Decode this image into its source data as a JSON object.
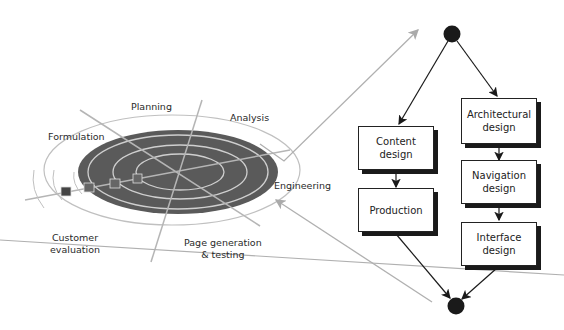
{
  "spiral": {
    "labels": {
      "planning": "Planning",
      "analysis": "Analysis",
      "formulation": "Formulation",
      "engineering": "Engineering",
      "customer_evaluation_line1": "Customer",
      "customer_evaluation_line2": "evaluation",
      "page_generation_line1": "Page generation",
      "page_generation_line2": "& testing"
    }
  },
  "flow": {
    "content_design": {
      "line1": "Content",
      "line2": "design"
    },
    "production": {
      "line1": "Production"
    },
    "architectural_design": {
      "line1": "Architectural",
      "line2": "design"
    },
    "navigation_design": {
      "line1": "Navigation",
      "line2": "design"
    },
    "interface_design": {
      "line1": "Interface",
      "line2": "design"
    }
  },
  "colors": {
    "ellipse_fill": "#5a5a5a",
    "ring_stroke": "#c8c8c8",
    "connector_gray": "#b0b0b0",
    "node_fill": "#1a1a1a"
  }
}
